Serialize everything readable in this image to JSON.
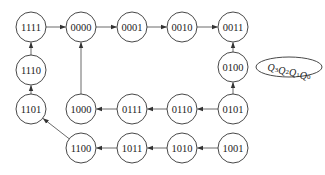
{
  "diagram": {
    "type": "state-transition-diagram",
    "node_radius": 15,
    "nodes": [
      {
        "id": "1111",
        "label": "1111",
        "x": 31,
        "y": 27
      },
      {
        "id": "0000",
        "label": "0000",
        "x": 81,
        "y": 27
      },
      {
        "id": "0001",
        "label": "0001",
        "x": 132,
        "y": 27
      },
      {
        "id": "0010",
        "label": "0010",
        "x": 182,
        "y": 27
      },
      {
        "id": "0011",
        "label": "0011",
        "x": 233,
        "y": 27
      },
      {
        "id": "1110",
        "label": "1110",
        "x": 31,
        "y": 70
      },
      {
        "id": "0100",
        "label": "0100",
        "x": 233,
        "y": 67
      },
      {
        "id": "1101",
        "label": "1101",
        "x": 31,
        "y": 109
      },
      {
        "id": "1000",
        "label": "1000",
        "x": 81,
        "y": 109
      },
      {
        "id": "0111",
        "label": "0111",
        "x": 132,
        "y": 109
      },
      {
        "id": "0110",
        "label": "0110",
        "x": 182,
        "y": 109
      },
      {
        "id": "0101",
        "label": "0101",
        "x": 233,
        "y": 109
      },
      {
        "id": "1100",
        "label": "1100",
        "x": 81,
        "y": 148
      },
      {
        "id": "1011",
        "label": "1011",
        "x": 132,
        "y": 148
      },
      {
        "id": "1010",
        "label": "1010",
        "x": 182,
        "y": 148
      },
      {
        "id": "1001",
        "label": "1001",
        "x": 233,
        "y": 148
      }
    ],
    "edges": [
      {
        "from": "1111",
        "to": "0000"
      },
      {
        "from": "0000",
        "to": "0001"
      },
      {
        "from": "0001",
        "to": "0010"
      },
      {
        "from": "0010",
        "to": "0011"
      },
      {
        "from": "0100",
        "to": "0011"
      },
      {
        "from": "0101",
        "to": "0100"
      },
      {
        "from": "0101",
        "to": "0110"
      },
      {
        "from": "0110",
        "to": "0111"
      },
      {
        "from": "0111",
        "to": "1000"
      },
      {
        "from": "1000",
        "to": "0000"
      },
      {
        "from": "1001",
        "to": "1010"
      },
      {
        "from": "1010",
        "to": "1011"
      },
      {
        "from": "1011",
        "to": "1100"
      },
      {
        "from": "1100",
        "to": "1101"
      },
      {
        "from": "1101",
        "to": "1110"
      },
      {
        "from": "1110",
        "to": "1111"
      }
    ],
    "legend": {
      "label": "Q3Q2Q1Q0",
      "parts": [
        {
          "base": "Q",
          "sub": "3"
        },
        {
          "base": "Q",
          "sub": "2"
        },
        {
          "base": "Q",
          "sub": "1"
        },
        {
          "base": "Q",
          "sub": "0"
        }
      ],
      "cx": 289,
      "cy": 67,
      "rx": 33,
      "ry": 10
    }
  }
}
